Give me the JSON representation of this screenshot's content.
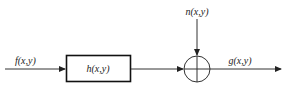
{
  "diagram": {
    "input_label": "f(x,y)",
    "block_label": "h(x,y)",
    "noise_label": "n(x,y)",
    "output_label": "g(x,y)",
    "summing_junction": "plus",
    "stroke_color": "#222222",
    "background_color": "#ffffff"
  }
}
